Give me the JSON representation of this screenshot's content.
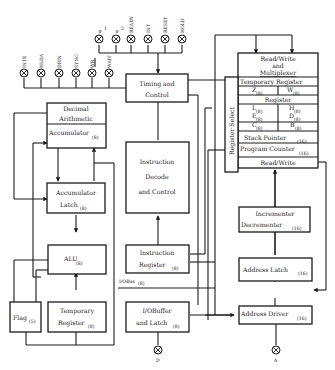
{
  "diagram": {
    "pins_top_left": [
      {
        "id": "inte",
        "label": "INTE",
        "x": 24
      },
      {
        "id": "hlda",
        "label": "HLDA",
        "x": 41
      },
      {
        "id": "dbin",
        "label": "DBIN",
        "x": 59
      },
      {
        "id": "sync",
        "label": "SYNC",
        "x": 76
      },
      {
        "id": "wr",
        "label": "WR",
        "x": 92
      },
      {
        "id": "wait",
        "label": "WAIT",
        "x": 109
      }
    ],
    "pins_top_right": [
      {
        "id": "phi1",
        "label": "φ",
        "sub": "1",
        "x": 99
      },
      {
        "id": "phi2",
        "label": "φ",
        "sub": "2",
        "x": 116
      },
      {
        "id": "ready",
        "label": "READY",
        "x": 131
      },
      {
        "id": "int",
        "label": "INT",
        "x": 148
      },
      {
        "id": "reset",
        "label": "RESET",
        "x": 165
      },
      {
        "id": "hold",
        "label": "HOLD",
        "x": 182
      }
    ],
    "pins_bottom": [
      {
        "id": "d",
        "label": "D"
      },
      {
        "id": "a",
        "label": "A"
      }
    ],
    "blocks": {
      "timing": {
        "line1": "Timing and",
        "line2": "Control"
      },
      "decimal": {
        "line1": "Decimal",
        "line2": "Arithmetic"
      },
      "accumulator": {
        "label": "Accumulator",
        "size": "(8)"
      },
      "acc_latch": {
        "line1": "Accumulator",
        "line2": "Latch",
        "size": "(8)"
      },
      "alu": {
        "label": "ALU",
        "size": "(8)"
      },
      "flag": {
        "label": "Flag",
        "size": "(5)"
      },
      "temp_reg": {
        "line1": "Temporary",
        "line2": "Register",
        "size": "(8)"
      },
      "instr_decode": {
        "line1": "Instruction",
        "line2": "Decode",
        "line3": "and Control"
      },
      "instr_reg": {
        "line1": "Instruction",
        "line2": "Register",
        "size": "(8)"
      },
      "io_bus": {
        "label": "I/OBus",
        "size": "(8)"
      },
      "io_buffer": {
        "line1": "I/OBuffer",
        "line2": "and Latch",
        "size": "(8)"
      },
      "rw_mux": {
        "line1": "Read/Write",
        "line2": "and",
        "line3": "Multiplexer"
      },
      "reg_select": {
        "label": "Register Select"
      },
      "reg_file": {
        "temp_register": "Temporary Register",
        "z": "Z",
        "w": "W",
        "register": "Register",
        "l": "L",
        "h": "H",
        "e": "E",
        "d": "D",
        "c": "C",
        "b": "B",
        "size8": "(8)",
        "stack_pointer": "Stack Pointer",
        "program_counter": "Program Counter",
        "size16": "(16)",
        "read_write": "Read/Write"
      },
      "inc_dec": {
        "line1": "Incrementer",
        "line2": "Decrementer",
        "size": "(16)"
      },
      "addr_latch": {
        "label": "Address Latch",
        "size": "(16)"
      },
      "addr_driver": {
        "label": "Address Driver",
        "size": "(16)"
      }
    }
  }
}
